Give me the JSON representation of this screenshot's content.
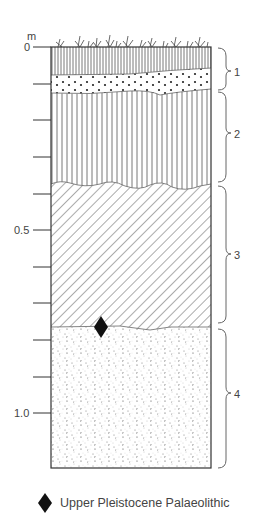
{
  "axis": {
    "unit_label": "m",
    "tick_labels": {
      "t0": "0",
      "t05": "0.5",
      "t10": "1.0"
    },
    "ticks_y": [
      47,
      84,
      120,
      157,
      194,
      230,
      267,
      303,
      340,
      377,
      413
    ]
  },
  "layers": [
    {
      "id": "1",
      "label": "1",
      "pattern": "dense-vertical-lines + dotted-gravel",
      "top_m": 0.0,
      "bottom_m": 0.12
    },
    {
      "id": "2",
      "label": "2",
      "pattern": "vertical-lines",
      "top_m": 0.12,
      "bottom_m": 0.37
    },
    {
      "id": "3",
      "label": "3",
      "pattern": "diagonal-hatch",
      "top_m": 0.37,
      "bottom_m": 0.76
    },
    {
      "id": "4",
      "label": "4",
      "pattern": "fine-stipple",
      "top_m": 0.76,
      "bottom_m": 1.15
    }
  ],
  "marker": {
    "symbol": "diamond",
    "color": "#111111",
    "depth_m": 0.76
  },
  "legend": {
    "symbol": "diamond",
    "text": "Upper Pleistocene Palaeolithic"
  },
  "colors": {
    "ink": "#333333",
    "background": "#ffffff"
  }
}
